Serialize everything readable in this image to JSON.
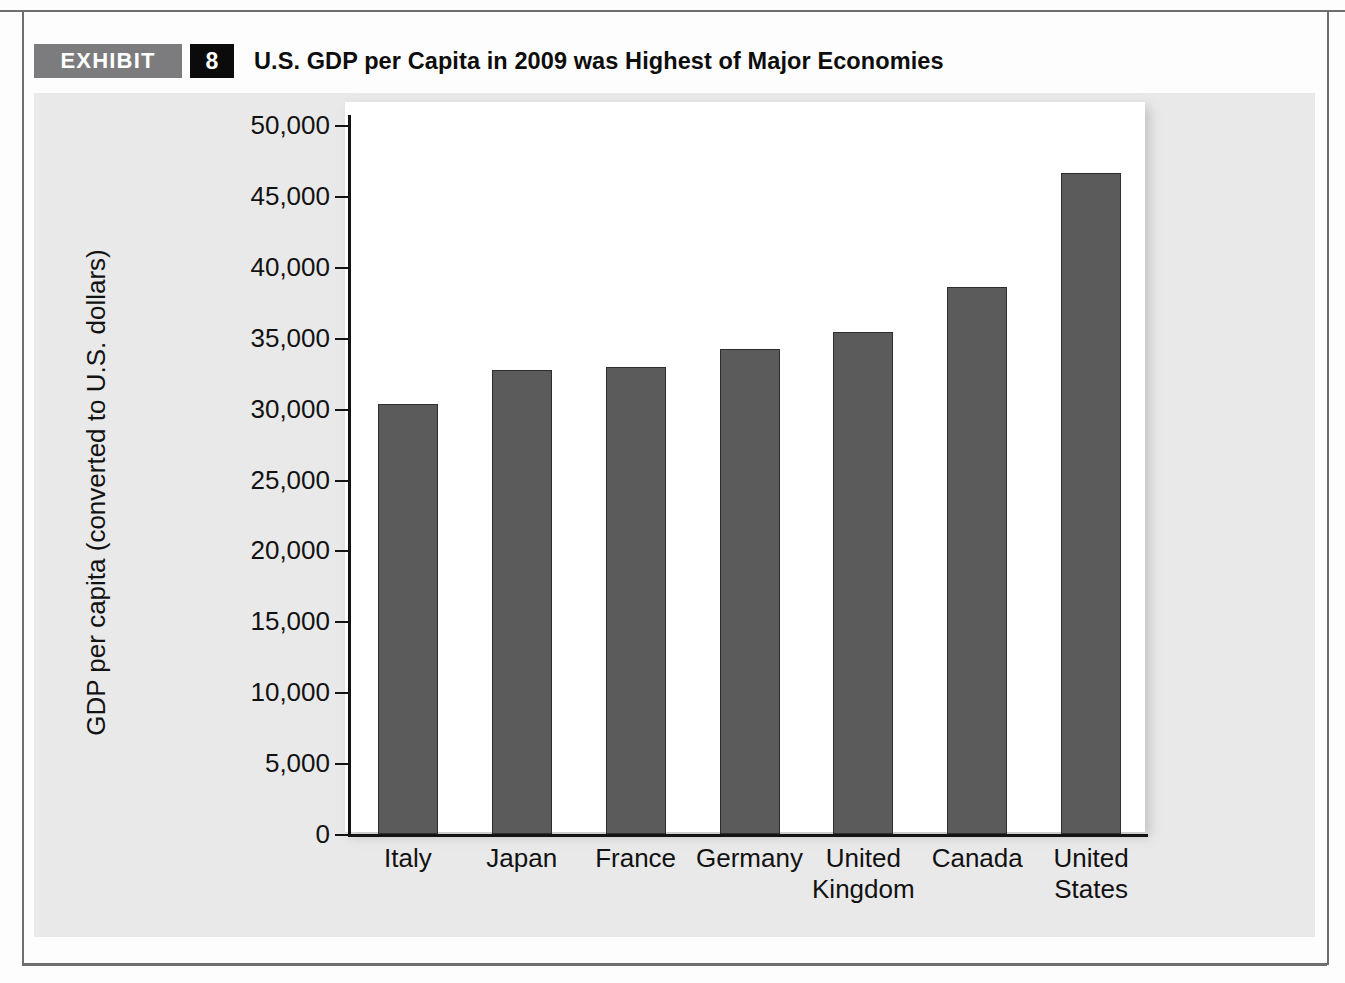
{
  "exhibit": {
    "badge_label": "EXHIBIT",
    "number": "8",
    "title": "U.S. GDP per Capita in 2009 was Highest of Major Economies"
  },
  "footnote_sliver": "",
  "colors": {
    "badge_gray": "#7c7c7e",
    "badge_black": "#0b0b0b",
    "panel_bg": "#e9e9e9",
    "plot_bg": "#ffffff",
    "bar_fill": "#5b5b5b",
    "bar_edge": "#2e2e2e",
    "axis": "#141414",
    "rule": "#6e6e70"
  },
  "chart_data": {
    "type": "bar",
    "title": "U.S. GDP per Capita in 2009 was Highest of Major Economies",
    "xlabel": "",
    "ylabel": "GDP per capita (converted to U.S. dollars)",
    "categories": [
      "Italy",
      "Japan",
      "France",
      "Germany",
      "United Kingdom",
      "Canada",
      "United States"
    ],
    "category_lines": [
      [
        "Italy"
      ],
      [
        "Japan"
      ],
      [
        "France"
      ],
      [
        "Germany"
      ],
      [
        "United",
        "Kingdom"
      ],
      [
        "Canada"
      ],
      [
        "United",
        "States"
      ]
    ],
    "values": [
      30300,
      32700,
      32900,
      34200,
      35400,
      38600,
      46600
    ],
    "ylim": [
      0,
      50000
    ],
    "yticks": [
      0,
      5000,
      10000,
      15000,
      20000,
      25000,
      30000,
      35000,
      40000,
      45000,
      50000
    ],
    "ytick_labels": [
      "0",
      "5,000",
      "10,000",
      "15,000",
      "20,000",
      "25,000",
      "30,000",
      "35,000",
      "40,000",
      "45,000",
      "50,000"
    ],
    "grid": false,
    "legend": null
  }
}
